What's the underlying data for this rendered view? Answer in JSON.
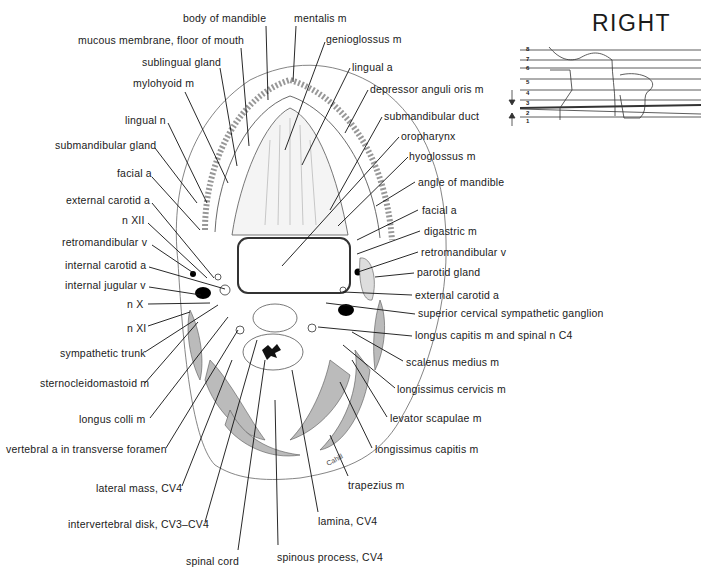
{
  "figure": {
    "orientation_label": "RIGHT",
    "signature": "Cahill",
    "level_diagram": {
      "levels": [
        "8",
        "7",
        "6",
        "5",
        "4",
        "3",
        "2",
        "1"
      ],
      "highlighted_level": "3"
    },
    "labels_left": [
      {
        "id": "body-of-mandible",
        "text": "body of mandible",
        "x": 183,
        "y": 12
      },
      {
        "id": "mucous-membrane",
        "text": "mucous membrane, floor of mouth",
        "x": 78,
        "y": 35
      },
      {
        "id": "sublingual-gland",
        "text": "sublingual gland",
        "x": 142,
        "y": 56
      },
      {
        "id": "mylohyoid-m",
        "text": "mylohyoid m",
        "x": 133,
        "y": 77
      },
      {
        "id": "lingual-n",
        "text": "lingual n",
        "x": 125,
        "y": 115
      },
      {
        "id": "submandibular-gland",
        "text": "submandibular gland",
        "x": 55,
        "y": 139
      },
      {
        "id": "facial-a-left",
        "text": "facial a",
        "x": 117,
        "y": 167
      },
      {
        "id": "external-carotid-a-left",
        "text": "external carotid a",
        "x": 66,
        "y": 195
      },
      {
        "id": "n-xii",
        "text": "n XII",
        "x": 122,
        "y": 215
      },
      {
        "id": "retromandibular-v-left",
        "text": "retromandibular v",
        "x": 62,
        "y": 236
      },
      {
        "id": "internal-carotid-a",
        "text": "internal carotid a",
        "x": 65,
        "y": 259
      },
      {
        "id": "internal-jugular-v",
        "text": "internal jugular v",
        "x": 65,
        "y": 279
      },
      {
        "id": "n-x",
        "text": "n X",
        "x": 127,
        "y": 298
      },
      {
        "id": "n-xi",
        "text": "n XI",
        "x": 127,
        "y": 322
      },
      {
        "id": "sympathetic-trunk",
        "text": "sympathetic trunk",
        "x": 60,
        "y": 347
      },
      {
        "id": "sternocleidomastoid-m",
        "text": "sternocleidomastoid m",
        "x": 40,
        "y": 377
      },
      {
        "id": "longus-colli-m",
        "text": "longus colli m",
        "x": 79,
        "y": 413
      },
      {
        "id": "vertebral-a",
        "text": "vertebral a in transverse foramen",
        "x": 6,
        "y": 443
      },
      {
        "id": "lateral-mass",
        "text": "lateral mass, CV4",
        "x": 96,
        "y": 482
      },
      {
        "id": "intervertebral-disk",
        "text": "intervertebral disk, CV3–CV4",
        "x": 68,
        "y": 518
      },
      {
        "id": "spinal-cord",
        "text": "spinal cord",
        "x": 186,
        "y": 555
      }
    ],
    "labels_right": [
      {
        "id": "mentalis-m",
        "text": "mentalis m",
        "x": 294,
        "y": 12
      },
      {
        "id": "genioglossus-m",
        "text": "genioglossus m",
        "x": 326,
        "y": 33
      },
      {
        "id": "lingual-a",
        "text": "lingual a",
        "x": 352,
        "y": 61
      },
      {
        "id": "depressor-anguli-oris-m",
        "text": "depressor anguli oris m",
        "x": 370,
        "y": 83
      },
      {
        "id": "submandibular-duct",
        "text": "submandibular duct",
        "x": 384,
        "y": 110
      },
      {
        "id": "oropharynx",
        "text": "oropharynx",
        "x": 401,
        "y": 130
      },
      {
        "id": "hyoglossus-m",
        "text": "hyoglossus m",
        "x": 409,
        "y": 150
      },
      {
        "id": "angle-of-mandible",
        "text": "angle of mandible",
        "x": 418,
        "y": 176
      },
      {
        "id": "facial-a-right",
        "text": "facial a",
        "x": 422,
        "y": 204
      },
      {
        "id": "digastric-m",
        "text": "digastric m",
        "x": 424,
        "y": 225
      },
      {
        "id": "retromandibular-v-right",
        "text": "retromandibular v",
        "x": 421,
        "y": 246
      },
      {
        "id": "parotid-gland",
        "text": "parotid gland",
        "x": 417,
        "y": 266
      },
      {
        "id": "external-carotid-a-right",
        "text": "external carotid a",
        "x": 415,
        "y": 289
      },
      {
        "id": "superior-cervical-sympathetic-ganglion",
        "text": "superior cervical sympathetic ganglion",
        "x": 418,
        "y": 307
      },
      {
        "id": "longus-capitis-m",
        "text": "longus capitis m and spinal n C4",
        "x": 415,
        "y": 329
      },
      {
        "id": "scalenus-medius-m",
        "text": "scalenus medius m",
        "x": 406,
        "y": 356
      },
      {
        "id": "longissimus-cervicis-m",
        "text": "longissimus cervicis m",
        "x": 397,
        "y": 383
      },
      {
        "id": "levator-scapulae-m",
        "text": "levator scapulae m",
        "x": 390,
        "y": 412
      },
      {
        "id": "longissimus-capitis-m",
        "text": "longissimus capitis m",
        "x": 375,
        "y": 443
      },
      {
        "id": "trapezius-m",
        "text": "trapezius m",
        "x": 348,
        "y": 479
      },
      {
        "id": "lamina-cv4",
        "text": "lamina, CV4",
        "x": 318,
        "y": 515
      },
      {
        "id": "spinous-process-cv4",
        "text": "spinous process, CV4",
        "x": 277,
        "y": 551
      }
    ]
  }
}
